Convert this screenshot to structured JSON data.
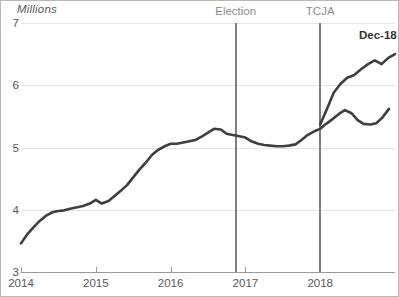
{
  "chart_data": {
    "type": "line",
    "title": "",
    "subtitle": "",
    "unit_label": "Millions",
    "xlabel": "",
    "ylabel": "Millions",
    "ylim": [
      3,
      7
    ],
    "xlim": [
      "2014-01",
      "2018-12"
    ],
    "grid": true,
    "legend_position": "none",
    "y_ticks": [
      "3",
      "4",
      "5",
      "6",
      "7"
    ],
    "y_tick_values": [
      3,
      4,
      5,
      6,
      7
    ],
    "x_ticks": [
      "2014",
      "2015",
      "2016",
      "2017",
      "2018"
    ],
    "x_tick_values": [
      2014,
      2015,
      2016,
      2017,
      2018
    ],
    "line_color": "#3f3f3f",
    "grid_color": "#e4e4e4",
    "axis_color": "#9a9a9a",
    "annotations": [
      {
        "name": "Election",
        "x_value": 2016.87,
        "label": "Election",
        "color": "#808080"
      },
      {
        "name": "TCJA",
        "x_value": 2018.0,
        "label": "TCJA",
        "color": "#808080"
      }
    ],
    "endpoint_label": "Dec-18",
    "endpoint_value": 6.5,
    "series": [
      {
        "name": "value",
        "x": [
          2014.0,
          2014.08,
          2014.17,
          2014.25,
          2014.33,
          2014.42,
          2014.5,
          2014.58,
          2014.67,
          2014.75,
          2014.83,
          2014.92,
          2015.0,
          2015.08,
          2015.17,
          2015.25,
          2015.33,
          2015.42,
          2015.5,
          2015.58,
          2015.67,
          2015.75,
          2015.83,
          2015.92,
          2016.0,
          2016.08,
          2016.17,
          2016.25,
          2016.33,
          2016.42,
          2016.5,
          2016.58,
          2016.67,
          2016.75,
          2016.83,
          2016.92,
          2017.0,
          2017.08,
          2017.17,
          2017.25,
          2017.33,
          2017.42,
          2017.5,
          2017.58,
          2017.67,
          2017.75,
          2017.83,
          2017.92,
          2018.0,
          2018.08,
          2018.17,
          2018.25,
          2018.33,
          2018.42,
          2018.5,
          2018.58,
          2018.67,
          2018.75,
          2018.83,
          2018.92
        ],
        "values": [
          3.46,
          3.6,
          3.72,
          3.82,
          3.9,
          3.96,
          3.98,
          3.99,
          4.02,
          4.04,
          4.06,
          4.1,
          4.16,
          4.1,
          4.14,
          4.22,
          4.3,
          4.4,
          4.52,
          4.64,
          4.76,
          4.88,
          4.96,
          5.02,
          5.06,
          5.06,
          5.08,
          5.1,
          5.12,
          5.18,
          5.24,
          5.3,
          5.29,
          5.22,
          5.2,
          5.18,
          5.16,
          5.1,
          5.06,
          5.04,
          5.03,
          5.02,
          5.02,
          5.03,
          5.05,
          5.12,
          5.2,
          5.26,
          5.3,
          5.38,
          5.46,
          5.54,
          5.6,
          5.55,
          5.44,
          5.38,
          5.37,
          5.39,
          5.48,
          5.62
        ]
      },
      {
        "name": "value_tail",
        "x": [
          2018.0,
          2018.09,
          2018.18,
          2018.27,
          2018.36,
          2018.45,
          2018.55,
          2018.64,
          2018.73,
          2018.82,
          2018.91,
          2019.0
        ],
        "values": [
          5.37,
          5.62,
          5.88,
          6.02,
          6.12,
          6.16,
          6.26,
          6.34,
          6.4,
          6.34,
          6.44,
          6.5
        ]
      }
    ]
  }
}
